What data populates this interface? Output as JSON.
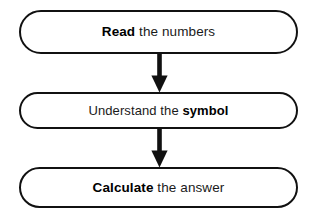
{
  "diagram": {
    "background_color": "#ffffff",
    "stroke_color": "#111111",
    "text_color": "#1a1a1a",
    "orientation": "vertical-top-to-bottom",
    "steps": [
      {
        "id": "step-read",
        "order": 1,
        "bold_text": "Read",
        "rest_text": " the numbers",
        "full_text": "Read the numbers"
      },
      {
        "id": "step-understand",
        "order": 2,
        "lead_text": "Understand the ",
        "bold_text": "symbol",
        "full_text": "Understand the symbol"
      },
      {
        "id": "step-calculate",
        "order": 3,
        "bold_text": "Calculate",
        "rest_text": " the answer",
        "full_text": "Calculate the answer"
      }
    ],
    "connectors": [
      {
        "id": "arrow-1",
        "from": "step-read",
        "to": "step-understand",
        "direction": "down"
      },
      {
        "id": "arrow-2",
        "from": "step-understand",
        "to": "step-calculate",
        "direction": "down"
      }
    ]
  }
}
